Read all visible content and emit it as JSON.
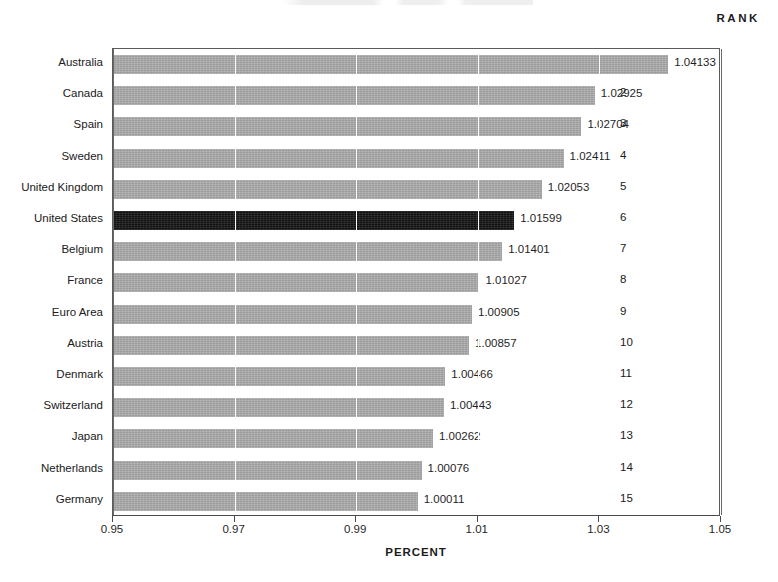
{
  "header": {
    "rank_label": "RANK"
  },
  "axis": {
    "x_title": "PERCENT",
    "x_ticks": [
      "0.95",
      "0.97",
      "0.99",
      "1.01",
      "1.03",
      "1.05"
    ]
  },
  "chart_data": {
    "type": "bar",
    "orientation": "horizontal",
    "title": "",
    "xlabel": "PERCENT",
    "ylabel": "",
    "xlim": [
      0.95,
      1.05
    ],
    "xticks": [
      0.95,
      0.97,
      0.99,
      1.01,
      1.03,
      1.05
    ],
    "grid": true,
    "legend": "none",
    "highlight_category": "United States",
    "colors": {
      "bar": "#a9a9a9",
      "highlight_bar": "#121212",
      "gridline": "#ffffff",
      "frame": "#5a5a5a",
      "text": "#1f1f1f"
    },
    "categories": [
      "Australia",
      "Canada",
      "Spain",
      "Sweden",
      "United Kingdom",
      "United States",
      "Belgium",
      "France",
      "Euro Area",
      "Austria",
      "Denmark",
      "Switzerland",
      "Japan",
      "Netherlands",
      "Germany"
    ],
    "values": [
      1.04133,
      1.02925,
      1.02704,
      1.02411,
      1.02053,
      1.01599,
      1.01401,
      1.01027,
      1.00905,
      1.00857,
      1.00466,
      1.00443,
      1.00262,
      1.00076,
      1.00011
    ],
    "value_labels": [
      "1.04133",
      "1.02925",
      "1.02704",
      "1.02411",
      "1.02053",
      "1.01599",
      "1.01401",
      "1.01027",
      "1.00905",
      "1.00857",
      "1.00466",
      "1.00443",
      "1.00262",
      "1.00076",
      "1.00011"
    ],
    "ranks": [
      "1",
      "2",
      "3",
      "4",
      "5",
      "6",
      "7",
      "8",
      "9",
      "10",
      "11",
      "12",
      "13",
      "14",
      "15"
    ]
  }
}
